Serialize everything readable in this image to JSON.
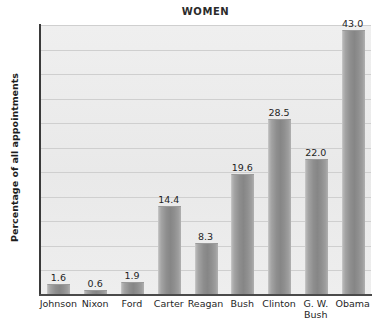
{
  "chart_data": {
    "type": "bar",
    "title": "WOMEN",
    "xlabel": "",
    "ylabel": "Percentage of all appointments",
    "ylim": [
      0,
      44
    ],
    "yticks": [
      4,
      8,
      12,
      16,
      20,
      24,
      28,
      32,
      36,
      40,
      44
    ],
    "grid": true,
    "legend": "none",
    "categories": [
      "Johnson",
      "Nixon",
      "Ford",
      "Carter",
      "Reagan",
      "Bush",
      "G. W. Bush",
      "Clinton",
      "Obama"
    ],
    "bars": [
      {
        "label_line1": "Johnson",
        "label_line2": "",
        "value": 1.6,
        "value_text": "1.6"
      },
      {
        "label_line1": "Nixon",
        "label_line2": "",
        "value": 0.6,
        "value_text": "0.6"
      },
      {
        "label_line1": "Ford",
        "label_line2": "",
        "value": 1.9,
        "value_text": "1.9"
      },
      {
        "label_line1": "Carter",
        "label_line2": "",
        "value": 14.4,
        "value_text": "14.4"
      },
      {
        "label_line1": "Reagan",
        "label_line2": "",
        "value": 8.3,
        "value_text": "8.3"
      },
      {
        "label_line1": "Bush",
        "label_line2": "",
        "value": 19.6,
        "value_text": "19.6"
      },
      {
        "label_line1": "Clinton",
        "label_line2": "",
        "value": 28.5,
        "value_text": "28.5"
      },
      {
        "label_line1": "G. W.",
        "label_line2": "Bush",
        "value": 22.0,
        "value_text": "22.0"
      },
      {
        "label_line1": "Obama",
        "label_line2": "",
        "value": 43.0,
        "value_text": "43.0"
      }
    ],
    "values": [
      1.6,
      0.6,
      1.9,
      14.4,
      8.3,
      19.6,
      28.5,
      22.0,
      43.0
    ],
    "colors": {
      "bar_light": "#b7b7b7",
      "bar_dark": "#868686",
      "plot_background": "#ececec",
      "gridline": "#cfcfcf",
      "axis": "#3a3a3a",
      "text": "#1f1f1f"
    }
  }
}
